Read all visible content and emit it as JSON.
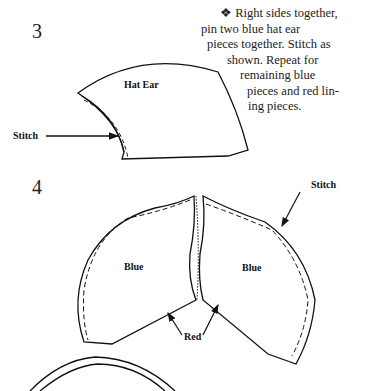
{
  "steps": [
    {
      "number": "3"
    },
    {
      "number": "4"
    }
  ],
  "instructions": {
    "bullet": "❖",
    "lines": [
      "Right sides together,",
      "pin two blue hat ear",
      "pieces together. Stitch as",
      "shown. Repeat for",
      "remaining blue",
      "pieces and red lin-",
      "ing pieces."
    ]
  },
  "figure3": {
    "piece_label": "Hat Ear",
    "stitch_label": "Stitch"
  },
  "figure4": {
    "left_label": "Blue",
    "right_label": "Blue",
    "stitch_label": "Stitch",
    "red_label": "Red"
  }
}
